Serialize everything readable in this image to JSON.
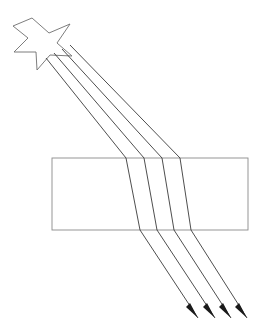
{
  "figure": {
    "background_color": "#ffffff",
    "width": 266,
    "height": 327
  },
  "colors": {
    "ray_stroke": "#3a3a3a",
    "arrow_fill": "#1a1a1a",
    "slab_stroke": "#8a8a8a",
    "star_stroke": "#6e6e6e",
    "star_fill": "#ffffff",
    "background": "#ffffff"
  },
  "strokes": {
    "ray_width": 0.9,
    "slab_width": 0.9,
    "star_width": 0.9
  },
  "source": {
    "name": "star-light-source",
    "kind": "four-pointed-star",
    "center_x": 38,
    "center_y": 42,
    "points": "32,18 49,33 70,24 57,43 72,56 50,55 37,70 36,52 14,52 28,38 13,26"
  },
  "slab": {
    "name": "glass-slab",
    "x": 52,
    "y": 158,
    "width": 196,
    "height": 72,
    "top_y": 158,
    "bottom_y": 230
  },
  "chart_data": {
    "type": "diagram",
    "elements": [
      "four-pointed star light source",
      "four parallel incident rays",
      "rectangular transparent slab",
      "four refracted rays inside slab",
      "four emergent rays with arrowheads"
    ],
    "ray_count": 4,
    "incident_direction_degrees": 47,
    "refracted_direction_degrees": 82,
    "emergent_direction_degrees": 47,
    "slab_bounds": {
      "left": 52,
      "top": 158,
      "right": 248,
      "bottom": 230
    },
    "rays": [
      {
        "index": 1,
        "start": [
          46,
          58
        ],
        "entry": [
          126,
          158
        ],
        "exit": [
          140,
          230
        ],
        "tip": [
          198,
          318
        ]
      },
      {
        "index": 2,
        "start": [
          54,
          53
        ],
        "entry": [
          144,
          158
        ],
        "exit": [
          157,
          230
        ],
        "tip": [
          215,
          318
        ]
      },
      {
        "index": 3,
        "start": [
          62,
          49
        ],
        "entry": [
          162,
          158
        ],
        "exit": [
          174,
          230
        ],
        "tip": [
          231,
          318
        ]
      },
      {
        "index": 4,
        "start": [
          70,
          45
        ],
        "entry": [
          180,
          158
        ],
        "exit": [
          191,
          230
        ],
        "tip": [
          247,
          318
        ]
      }
    ],
    "arrowheads": [
      {
        "index": 1,
        "polygon": "198,318 186,307 190,303"
      },
      {
        "index": 2,
        "polygon": "215,318 203,307 207,303"
      },
      {
        "index": 3,
        "polygon": "231,318 219,307 223,303"
      },
      {
        "index": 4,
        "polygon": "247,318 235,307 239,303"
      }
    ]
  }
}
